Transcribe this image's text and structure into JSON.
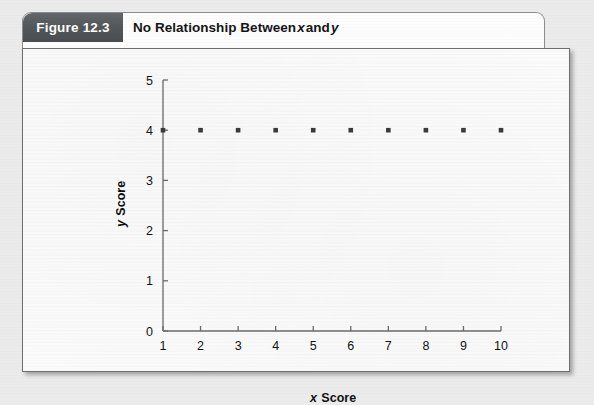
{
  "figure": {
    "chip_label": "Figure 12.3",
    "title_prefix": "No Relationship Between ",
    "title_var_x": "x",
    "title_conjunction": " and ",
    "title_var_y": "y"
  },
  "colors": {
    "chip_background": "#55585a",
    "chip_text": "#ffffff",
    "card_background": "#fbfbfb",
    "card_border": "#6f6f6f",
    "page_background": "#ebebeb",
    "axis": "#6b6b6b",
    "marker": "#3b3b3b",
    "text": "#131313"
  },
  "chart_data": {
    "type": "scatter",
    "title": "No Relationship Between x and y",
    "xlabel": "x Score",
    "ylabel": "y Score",
    "xlim": [
      1,
      10
    ],
    "ylim": [
      0,
      5
    ],
    "grid": false,
    "legend": null,
    "xticks": [
      1,
      2,
      3,
      4,
      5,
      6,
      7,
      8,
      9,
      10
    ],
    "yticks": [
      0,
      1,
      2,
      3,
      4,
      5
    ],
    "xtick_labels": [
      "1",
      "2",
      "3",
      "4",
      "5",
      "6",
      "7",
      "8",
      "9",
      "10"
    ],
    "ytick_labels": [
      "0",
      "1",
      "2",
      "3",
      "4",
      "5"
    ],
    "marker_shape": "square",
    "series": [
      {
        "name": "y scores",
        "x": [
          1,
          2,
          3,
          4,
          5,
          6,
          7,
          8,
          9,
          10
        ],
        "y": [
          4,
          4,
          4,
          4,
          4,
          4,
          4,
          4,
          4,
          4
        ]
      }
    ]
  }
}
